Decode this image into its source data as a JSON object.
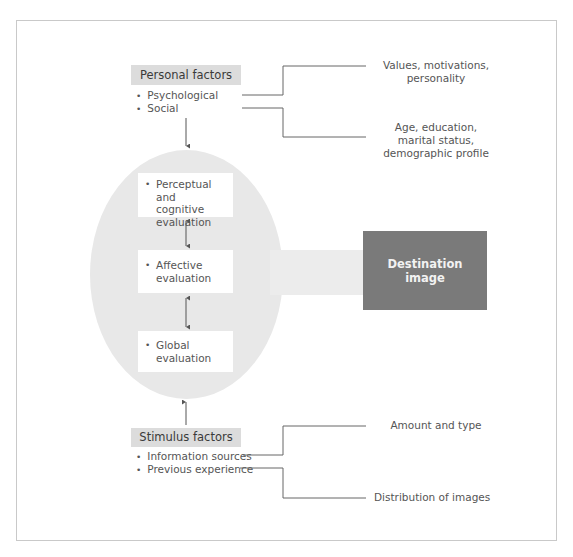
{
  "personal_factors": {
    "title": "Personal factors",
    "items": [
      "Psychological",
      "Social"
    ]
  },
  "evaluations": [
    {
      "label_line1": "Perceptual and",
      "label_line2": "cognitive",
      "label_line3": "evaluation"
    },
    {
      "label_line1": "Affective",
      "label_line2": "evaluation"
    },
    {
      "label_line1": "Global",
      "label_line2": "evaluation"
    }
  ],
  "destination": {
    "line1": "Destination",
    "line2": "image"
  },
  "stimulus_factors": {
    "title": "Stimulus factors",
    "items": [
      "Information sources",
      "Previous experience"
    ]
  },
  "notes": {
    "psych_line1": "Values, motivations,",
    "psych_line2": "personality",
    "social_line1": "Age, education,",
    "social_line2": "marital status,",
    "social_line3": "demographic profile",
    "info_sources": "Amount and type",
    "prev_experience": "Distribution of images"
  },
  "colors": {
    "header_bg": "#dcdcdc",
    "ellipse_bg": "#e8e8e8",
    "destination_bg": "#7a7a7a",
    "line": "#555555"
  }
}
